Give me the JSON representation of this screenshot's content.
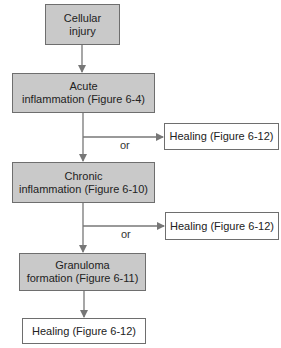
{
  "diagram": {
    "type": "flowchart",
    "colors": {
      "shaded_fill": "#c9c9c9",
      "border": "#6e6e6e",
      "line": "#777777",
      "text": "#222222"
    },
    "nodes": [
      {
        "id": "cellular_injury",
        "label": "Cellular\ninjury",
        "style": "shaded"
      },
      {
        "id": "acute",
        "label": "Acute\ninflammation (Figure 6-4)",
        "style": "shaded"
      },
      {
        "id": "healing1",
        "label": "Healing (Figure 6-12)",
        "style": "plain"
      },
      {
        "id": "chronic",
        "label": "Chronic\ninflammation (Figure 6-10)",
        "style": "shaded"
      },
      {
        "id": "healing2",
        "label": "Healing (Figure 6-12)",
        "style": "plain"
      },
      {
        "id": "granuloma",
        "label": "Granuloma\nformation (Figure 6-11)",
        "style": "shaded"
      },
      {
        "id": "healing3",
        "label": "Healing (Figure 6-12)",
        "style": "plain"
      }
    ],
    "edges": [
      {
        "from": "cellular_injury",
        "to": "acute"
      },
      {
        "from": "acute",
        "to": "healing1",
        "label": "or"
      },
      {
        "from": "acute",
        "to": "chronic"
      },
      {
        "from": "chronic",
        "to": "healing2",
        "label": "or"
      },
      {
        "from": "chronic",
        "to": "granuloma"
      },
      {
        "from": "granuloma",
        "to": "healing3"
      }
    ],
    "branch_labels": [
      "or",
      "or"
    ]
  }
}
